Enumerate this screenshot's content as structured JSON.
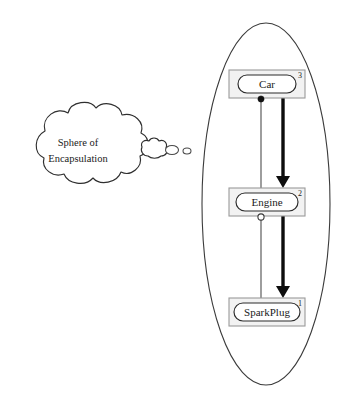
{
  "diagram": {
    "title": "Sphere of Encapsulation",
    "type": "uml-encapsulation-diagram",
    "canvas": {
      "width": 346,
      "height": 404,
      "background": "#ffffff"
    },
    "thought_cloud": {
      "label_line_1": "Sphere of",
      "label_line_2": "Encapsulation",
      "center_x": 78,
      "center_y": 150,
      "fill": "#ffffff",
      "stroke": "#2f2f2f"
    },
    "trail_bubbles": [
      {
        "name": "bubble-large",
        "cx": 151,
        "cy": 149,
        "rx": 12,
        "ry": 8
      },
      {
        "name": "bubble-medium",
        "cx": 172,
        "cy": 150,
        "rx": 6.5,
        "ry": 4.5
      },
      {
        "name": "bubble-small",
        "cx": 187,
        "cy": 151,
        "rx": 4,
        "ry": 3
      }
    ],
    "sphere": {
      "name": "sphere-of-encapsulation-boundary",
      "cx": 266,
      "cy": 204,
      "rx": 64,
      "ry": 181,
      "stroke": "#3b3b3b"
    },
    "nodes": [
      {
        "id": "car",
        "label": "Car",
        "index": "3",
        "box": {
          "x": 229,
          "y": 70,
          "w": 76,
          "h": 28
        },
        "capsule": {
          "x": 238,
          "y": 75,
          "w": 58,
          "h": 18
        }
      },
      {
        "id": "engine",
        "label": "Engine",
        "index": "2",
        "box": {
          "x": 229,
          "y": 188,
          "w": 76,
          "h": 28
        },
        "capsule": {
          "x": 236,
          "y": 193,
          "w": 62,
          "h": 18
        }
      },
      {
        "id": "sparkplug",
        "label": "SparkPlug",
        "index": "1",
        "box": {
          "x": 229,
          "y": 298,
          "w": 76,
          "h": 28
        },
        "capsule": {
          "x": 234,
          "y": 303,
          "w": 66,
          "h": 18
        }
      }
    ],
    "connectors": [
      {
        "id": "thin-car-to-sparkplug",
        "kind": "thin-line",
        "from": "car",
        "to": "sparkplug",
        "x": 261,
        "y_start": 98,
        "y_end": 305,
        "stroke": "#4d4d4d"
      },
      {
        "id": "thick-car-to-engine",
        "kind": "thick-arrow",
        "from": "car",
        "to": "engine",
        "x": 283,
        "y_start": 98,
        "y_end": 186,
        "stroke": "#0d0d0d"
      },
      {
        "id": "thick-engine-to-sparkplug",
        "kind": "thick-arrow",
        "from": "engine",
        "to": "sparkplug",
        "x": 283,
        "y_start": 216,
        "y_end": 296,
        "stroke": "#0d0d0d"
      }
    ],
    "endpoints": [
      {
        "id": "car-filled-endpoint",
        "kind": "filled-circle",
        "cx": 261,
        "cy": 99,
        "r": 3.1
      },
      {
        "id": "engine-hollow-endpoint",
        "kind": "hollow-circle",
        "cx": 261,
        "cy": 217,
        "r": 3.1
      }
    ]
  }
}
